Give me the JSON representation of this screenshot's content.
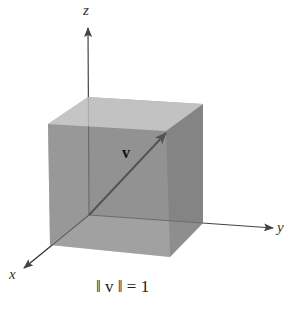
{
  "diagram": {
    "type": "3d-unit-cube-vector",
    "axes": {
      "x": {
        "label": "x"
      },
      "y": {
        "label": "y"
      },
      "z": {
        "label": "z"
      }
    },
    "vector": {
      "label": "v"
    },
    "caption": "‖ v ‖ = 1",
    "colors": {
      "background": "#ffffff",
      "top_face": "#d6d6d6",
      "front_face": "#a6a6a6",
      "right_face": "#8c8c8c",
      "bottom_face": "#bdbdbd",
      "left_face": "#b3b3b3",
      "back_face": "#999999",
      "axis": "#444444",
      "vector": "#111111"
    }
  }
}
